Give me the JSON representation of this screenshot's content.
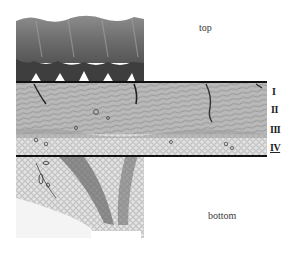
{
  "figure": {
    "labels": {
      "top": "top",
      "bottom": "bottom"
    },
    "layers": [
      {
        "numeral": "I"
      },
      {
        "numeral": "II"
      },
      {
        "numeral": "III"
      },
      {
        "numeral": "IV"
      }
    ],
    "colors": {
      "epidermis_dark": "#4a4a4a",
      "stratum_light": "#9a9a9a",
      "dermis": "#a8a8a8",
      "fat_cells": "#d6d6d6",
      "band_line": "#111111"
    }
  }
}
